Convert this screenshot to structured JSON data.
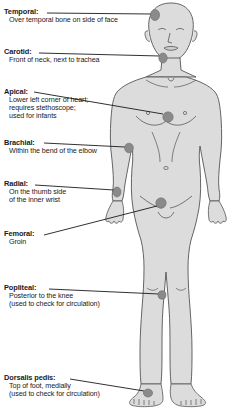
{
  "diagram": {
    "colors": {
      "body_fill": "#dcdcdc",
      "body_outline": "#555555",
      "marker_fill": "#8a8a8a",
      "marker_outline": "#6e6e6e",
      "leader_line": "#1a1a1a",
      "text": "#1a1a1a",
      "background": "#ffffff"
    },
    "callouts": [
      {
        "id": "temporal",
        "title": "Temporal:",
        "lines": [
          "Over temporal bone on side of face"
        ],
        "marker": {
          "x": 155,
          "y": 15,
          "rx": 4.6,
          "ry": 5.6
        },
        "leader": {
          "x1": 47,
          "y1": 13,
          "x2": 151,
          "y2": 14
        }
      },
      {
        "id": "carotid",
        "title": "Carotid:",
        "lines": [
          "Front of neck, next to trachea"
        ],
        "marker": {
          "x": 163,
          "y": 58,
          "rx": 4.2,
          "ry": 5.0
        },
        "leader": {
          "x1": 39,
          "y1": 53,
          "x2": 160,
          "y2": 56
        }
      },
      {
        "id": "apical",
        "title": "Apical:",
        "lines": [
          "Lower left corner of heart;",
          "requires stethoscope;",
          "used for infants"
        ],
        "marker": {
          "x": 168,
          "y": 117,
          "rx": 5.2,
          "ry": 5.2
        },
        "leader": {
          "x1": 34,
          "y1": 92,
          "x2": 163,
          "y2": 114
        }
      },
      {
        "id": "brachial",
        "title": "Brachial:",
        "lines": [
          "Within the bend of the elbow"
        ],
        "marker": {
          "x": 129,
          "y": 148,
          "rx": 4.4,
          "ry": 4.8
        },
        "leader": {
          "x1": 44,
          "y1": 143,
          "x2": 125,
          "y2": 147
        }
      },
      {
        "id": "radial",
        "title": "Radial:",
        "lines": [
          "On the thumb side",
          "of the inner wrist"
        ],
        "marker": {
          "x": 117,
          "y": 192,
          "rx": 4.0,
          "ry": 5.0
        },
        "leader": {
          "x1": 35,
          "y1": 185,
          "x2": 114,
          "y2": 190
        }
      },
      {
        "id": "femoral",
        "title": "Femoral:",
        "lines": [
          "Groin"
        ],
        "marker": {
          "x": 161,
          "y": 203,
          "rx": 5.2,
          "ry": 5.2
        },
        "leader": {
          "x1": 44,
          "y1": 235,
          "x2": 157,
          "y2": 206
        }
      },
      {
        "id": "popliteal",
        "title": "Popliteal:",
        "lines": [
          "Posterior to the knee",
          "(used to check for circulation)"
        ],
        "marker": {
          "x": 162,
          "y": 295,
          "rx": 4.0,
          "ry": 4.2
        },
        "leader": {
          "x1": 49,
          "y1": 289,
          "x2": 159,
          "y2": 294
        }
      },
      {
        "id": "dorsalis-pedis",
        "title": "Dorsalis pedis:",
        "lines": [
          "Top of foot, medially",
          "(used to check for circulation)"
        ],
        "marker": {
          "x": 148,
          "y": 393,
          "rx": 4.6,
          "ry": 4.0
        },
        "leader": {
          "x1": 70,
          "y1": 379,
          "x2": 144,
          "y2": 391
        }
      }
    ]
  }
}
